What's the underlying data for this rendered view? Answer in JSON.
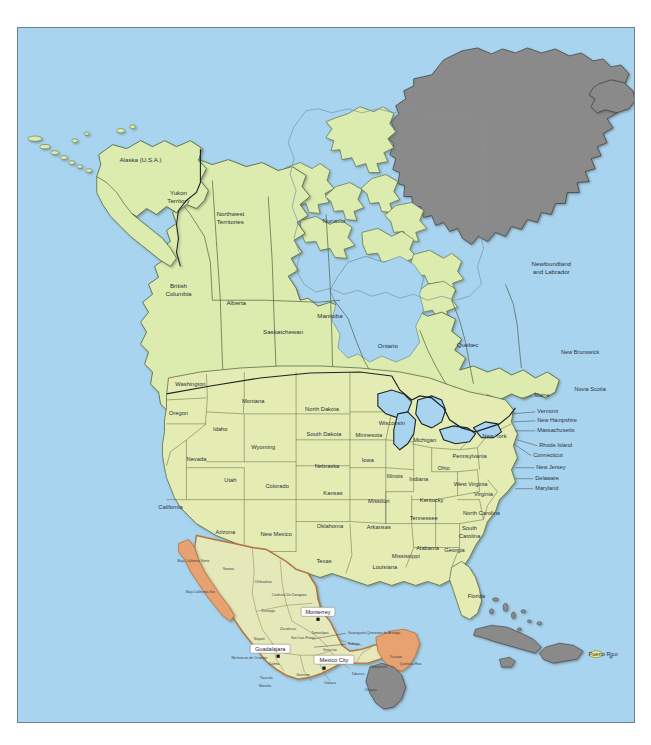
{
  "map": {
    "title": "North America political map",
    "colors": {
      "ocean": "#a8d4ef",
      "usa_fill": "#e4ecb4",
      "canada_fill": "#dcebae",
      "mexico_fill": "#e5e9b9",
      "mexico_coast": "#e8a170",
      "other_fill": "#8a8a8a",
      "territory_fill": "#ece98f",
      "border": "#5d6b4e",
      "country_border": "#1d2328",
      "frame": "#6f7f8c"
    },
    "canada": {
      "label": "Canada",
      "provinces": [
        {
          "name": "Yukon Territory",
          "label": "Yukon\nTerritory",
          "lines": [
            "Yukon",
            "Territory"
          ],
          "x": 178,
          "y": 196
        },
        {
          "name": "Northwest Territories",
          "lines": [
            "Northwest",
            "Territories"
          ],
          "x": 230,
          "y": 218
        },
        {
          "name": "Nunavut",
          "lines": [
            "Nunavut"
          ],
          "x": 334,
          "y": 221
        },
        {
          "name": "British Columbia",
          "lines": [
            "British",
            "Columbia"
          ],
          "x": 178,
          "y": 290
        },
        {
          "name": "Alberta",
          "lines": [
            "Alberta"
          ],
          "x": 236,
          "y": 303
        },
        {
          "name": "Saskatchewan",
          "lines": [
            "Saskatchewan"
          ],
          "x": 283,
          "y": 332
        },
        {
          "name": "Manitoba",
          "lines": [
            "Manitoba"
          ],
          "x": 330,
          "y": 316
        },
        {
          "name": "Ontario",
          "lines": [
            "Ontario"
          ],
          "x": 388,
          "y": 346
        },
        {
          "name": "Quebec",
          "lines": [
            "Quebec"
          ],
          "x": 468,
          "y": 345
        },
        {
          "name": "Newfoundland and Labrador",
          "lines": [
            "Newfoundland",
            "and Labrador"
          ],
          "x": 552,
          "y": 268
        },
        {
          "name": "New Brunswick",
          "lines": [
            "New Brunswick"
          ],
          "x": 581,
          "y": 352
        },
        {
          "name": "Novia Scotia",
          "lines": [
            "Novia Scotia"
          ],
          "x": 591,
          "y": 390
        }
      ]
    },
    "usa": {
      "label": "United States",
      "alaska_label": "Alaska (U.S.A.)",
      "alaska_x": 140,
      "alaska_y": 160,
      "states": [
        {
          "name": "Washington",
          "lines": [
            "Washington"
          ],
          "x": 190,
          "y": 385
        },
        {
          "name": "Oregon",
          "lines": [
            "Oregon"
          ],
          "x": 178,
          "y": 414
        },
        {
          "name": "Montana",
          "lines": [
            "Montana"
          ],
          "x": 253,
          "y": 402
        },
        {
          "name": "Idaho",
          "lines": [
            "Idaho"
          ],
          "x": 220,
          "y": 430
        },
        {
          "name": "Wyoming",
          "lines": [
            "Wyoming"
          ],
          "x": 263,
          "y": 448
        },
        {
          "name": "North Dakota",
          "lines": [
            "North Dakota"
          ],
          "x": 322,
          "y": 410
        },
        {
          "name": "South Dakota",
          "lines": [
            "South Dakota"
          ],
          "x": 324,
          "y": 435
        },
        {
          "name": "Nebraska",
          "lines": [
            "Nebraska"
          ],
          "x": 327,
          "y": 467
        },
        {
          "name": "Minnesota",
          "lines": [
            "Minnesota"
          ],
          "x": 369,
          "y": 436
        },
        {
          "name": "Iowa",
          "lines": [
            "Iowa"
          ],
          "x": 368,
          "y": 461
        },
        {
          "name": "Wisconsin",
          "lines": [
            "Wisconsin"
          ],
          "x": 392,
          "y": 424
        },
        {
          "name": "Illinois",
          "lines": [
            "Illinois"
          ],
          "x": 395,
          "y": 477
        },
        {
          "name": "Michigan",
          "lines": [
            "Michigan"
          ],
          "x": 425,
          "y": 441
        },
        {
          "name": "Indiana",
          "lines": [
            "Indiana"
          ],
          "x": 419,
          "y": 480
        },
        {
          "name": "Ohio",
          "lines": [
            "Ohio"
          ],
          "x": 444,
          "y": 469
        },
        {
          "name": "Nevada",
          "lines": [
            "Nevada"
          ],
          "x": 196,
          "y": 460
        },
        {
          "name": "Utah",
          "lines": [
            "Utah"
          ],
          "x": 230,
          "y": 481
        },
        {
          "name": "Colorado",
          "lines": [
            "Colorado"
          ],
          "x": 277,
          "y": 487
        },
        {
          "name": "Kansas",
          "lines": [
            "Kansas"
          ],
          "x": 333,
          "y": 494
        },
        {
          "name": "Missouri",
          "lines": [
            "Missouri"
          ],
          "x": 379,
          "y": 502
        },
        {
          "name": "California",
          "lines": [
            "California"
          ],
          "x": 170,
          "y": 508
        },
        {
          "name": "Arizona",
          "lines": [
            "Arizona"
          ],
          "x": 225,
          "y": 533
        },
        {
          "name": "New Mexico",
          "lines": [
            "New Mexico"
          ],
          "x": 276,
          "y": 535
        },
        {
          "name": "Oklahoma",
          "lines": [
            "Oklahoma"
          ],
          "x": 330,
          "y": 527
        },
        {
          "name": "Arkansas",
          "lines": [
            "Arkansas"
          ],
          "x": 379,
          "y": 528
        },
        {
          "name": "Texas",
          "lines": [
            "Texas"
          ],
          "x": 324,
          "y": 562
        },
        {
          "name": "Louisiana",
          "lines": [
            "Louisiana"
          ],
          "x": 385,
          "y": 568
        },
        {
          "name": "Mississippi",
          "lines": [
            "Mississippi"
          ],
          "x": 406,
          "y": 557
        },
        {
          "name": "Alabama",
          "lines": [
            "Alabama"
          ],
          "x": 428,
          "y": 549
        },
        {
          "name": "Tennessee",
          "lines": [
            "Tennessee"
          ],
          "x": 424,
          "y": 519
        },
        {
          "name": "Kentucky",
          "lines": [
            "Kentucky"
          ],
          "x": 432,
          "y": 501
        },
        {
          "name": "West Virginia",
          "lines": [
            "West Virginia"
          ],
          "x": 471,
          "y": 485
        },
        {
          "name": "Virginia",
          "lines": [
            "Virginia"
          ],
          "x": 484,
          "y": 495
        },
        {
          "name": "North Carolina",
          "lines": [
            "North Carolina"
          ],
          "x": 482,
          "y": 514
        },
        {
          "name": "South Carolina",
          "lines": [
            "South",
            "Carolina"
          ],
          "x": 470,
          "y": 533
        },
        {
          "name": "Georgia",
          "lines": [
            "Georgia"
          ],
          "x": 455,
          "y": 551
        },
        {
          "name": "Florida",
          "lines": [
            "Florida"
          ],
          "x": 477,
          "y": 597
        },
        {
          "name": "Pennsylvania",
          "lines": [
            "Pennsylvania"
          ],
          "x": 470,
          "y": 457
        },
        {
          "name": "New York",
          "lines": [
            "New York"
          ],
          "x": 495,
          "y": 437
        }
      ],
      "callouts": [
        {
          "name": "Maine",
          "label": "Maine",
          "x": 535,
          "y": 396,
          "lx": 522,
          "ly": 398
        },
        {
          "name": "Vermont",
          "label": "Vermont",
          "x": 538,
          "y": 412,
          "lx": 512,
          "ly": 414
        },
        {
          "name": "New Hampshire",
          "label": "New Hampshire",
          "x": 538,
          "y": 421,
          "lx": 514,
          "ly": 422
        },
        {
          "name": "Massachusetts",
          "label": "Massachusetts",
          "x": 538,
          "y": 431,
          "lx": 516,
          "ly": 431
        },
        {
          "name": "Rhode Island",
          "label": "Rhode Island",
          "x": 540,
          "y": 446,
          "lx": 518,
          "ly": 440
        },
        {
          "name": "Connecticut",
          "label": "Connecticut",
          "x": 534,
          "y": 456,
          "lx": 514,
          "ly": 444
        },
        {
          "name": "New Jersey",
          "label": "New Jersey",
          "x": 537,
          "y": 468,
          "lx": 516,
          "ly": 468
        },
        {
          "name": "Delaware",
          "label": "Delaware",
          "x": 536,
          "y": 479,
          "lx": 516,
          "ly": 479
        },
        {
          "name": "Maryland",
          "label": "Maryland",
          "x": 536,
          "y": 489,
          "lx": 516,
          "ly": 489
        }
      ]
    },
    "mexico": {
      "label": "Mexico",
      "states": [
        {
          "name": "Baja California Norte",
          "lines": [
            "Baja California Norte"
          ],
          "x": 193,
          "y": 562
        },
        {
          "name": "Sonora",
          "lines": [
            "Sonora"
          ],
          "x": 228,
          "y": 570
        },
        {
          "name": "Baja California Sur",
          "lines": [
            "Baja California Sur"
          ],
          "x": 200,
          "y": 593
        },
        {
          "name": "Chihuahua",
          "lines": [
            "Chihuahua"
          ],
          "x": 263,
          "y": 583
        },
        {
          "name": "Coahuila De Zaragoza",
          "lines": [
            "Coahuila De Zaragoza"
          ],
          "x": 289,
          "y": 596
        },
        {
          "name": "Durango",
          "lines": [
            "Durango"
          ],
          "x": 268,
          "y": 612
        },
        {
          "name": "Zacatecas",
          "lines": [
            "Zacatecas"
          ],
          "x": 288,
          "y": 630
        },
        {
          "name": "Nuevo Leon",
          "lines": [
            "Nuevo Leon"
          ],
          "x": 312,
          "y": 615
        },
        {
          "name": "Tamaulipas",
          "lines": [
            "Tamaulipas"
          ],
          "x": 320,
          "y": 634
        },
        {
          "name": "San Luis Potosi",
          "lines": [
            "San Luis Potosi"
          ],
          "x": 303,
          "y": 639
        },
        {
          "name": "Nayarit",
          "lines": [
            "Nayarit"
          ],
          "x": 259,
          "y": 640
        },
        {
          "name": "Jalisco",
          "lines": [
            "Jalisco"
          ],
          "x": 272,
          "y": 651
        },
        {
          "name": "Veracruz",
          "lines": [
            "Veracruz"
          ],
          "x": 330,
          "y": 651
        },
        {
          "name": "Colima",
          "lines": [
            "Colima"
          ],
          "x": 274,
          "y": 665
        },
        {
          "name": "Michoacan de Ocampo",
          "lines": [
            "Michoacan de Ocampo"
          ],
          "x": 249,
          "y": 659
        },
        {
          "name": "Tlaxcala",
          "lines": [
            "Tlaxcala"
          ],
          "x": 266,
          "y": 679
        },
        {
          "name": "Morelos",
          "lines": [
            "Morelos"
          ],
          "x": 265,
          "y": 687
        },
        {
          "name": "Guerrero",
          "lines": [
            "Guerrero"
          ],
          "x": 303,
          "y": 676
        },
        {
          "name": "Oaxaca",
          "lines": [
            "Oaxaca"
          ],
          "x": 330,
          "y": 684
        },
        {
          "name": "Chiapas",
          "lines": [
            "Chiapas"
          ],
          "x": 371,
          "y": 691
        },
        {
          "name": "Tabasco",
          "lines": [
            "Tabasco"
          ],
          "x": 358,
          "y": 675
        },
        {
          "name": "Campeche",
          "lines": [
            "Campeche"
          ],
          "x": 379,
          "y": 668
        },
        {
          "name": "Yucatan",
          "lines": [
            "Yucatan"
          ],
          "x": 396,
          "y": 658
        },
        {
          "name": "Quintana Roo",
          "lines": [
            "Quintana Roo"
          ],
          "x": 411,
          "y": 665
        }
      ],
      "callout_states": [
        {
          "name": "Guanajuato Queretaro de Arteaga",
          "label": "Guanajuato Queretaro de Arteaga",
          "x": 348,
          "y": 634,
          "lx": 312,
          "ly": 640
        },
        {
          "name": "Hidalgo",
          "label": "Hidalgo",
          "x": 348,
          "y": 645,
          "lx": 314,
          "ly": 648
        }
      ],
      "cities": [
        {
          "name": "Monterrey",
          "label": "Monterrey",
          "x": 318,
          "y": 613,
          "dot_x": 318,
          "dot_y": 620
        },
        {
          "name": "Guadalajara",
          "label": "Guadalajara",
          "x": 270,
          "y": 650,
          "dot_x": 278,
          "dot_y": 657
        },
        {
          "name": "Mexico City",
          "label": "Mexico City",
          "x": 334,
          "y": 661,
          "dot_x": 324,
          "dot_y": 669
        }
      ]
    },
    "other": {
      "greenland": {
        "name": "Greenland",
        "shown_label": ""
      },
      "iceland": {
        "name": "Iceland",
        "shown_label": ""
      },
      "puerto_rico": {
        "name": "Puerto Rico",
        "label": "Puerto Rico",
        "x": 600,
        "y": 661
      }
    }
  }
}
